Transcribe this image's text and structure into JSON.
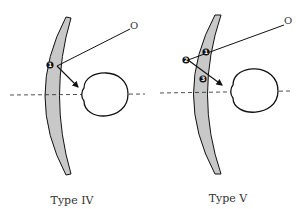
{
  "diagrams": [
    {
      "caption": "Type IV",
      "object_label": "O",
      "markers": [
        "1"
      ]
    },
    {
      "caption": "Type V",
      "object_label": "O",
      "markers": [
        "1",
        "2",
        "3"
      ]
    }
  ],
  "colors": {
    "lens_fill": "#c8c8c8",
    "stroke": "#111111",
    "marker_fill": "#111111"
  }
}
